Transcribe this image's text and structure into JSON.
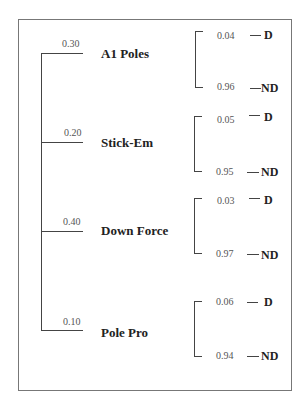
{
  "diagram": {
    "type": "probability-tree",
    "branches": [
      {
        "label": "A1 Poles",
        "prob": "0.30",
        "d_prob": "0.04",
        "nd_prob": "0.96"
      },
      {
        "label": "Stick-Em",
        "prob": "0.20",
        "d_prob": "0.05",
        "nd_prob": "0.95"
      },
      {
        "label": "Down Force",
        "prob": "0.40",
        "d_prob": "0.03",
        "nd_prob": "0.97"
      },
      {
        "label": "Pole Pro",
        "prob": "0.10",
        "d_prob": "0.06",
        "nd_prob": "0.94"
      }
    ],
    "outcomes": {
      "defective": "D",
      "not_defective": "ND"
    }
  }
}
